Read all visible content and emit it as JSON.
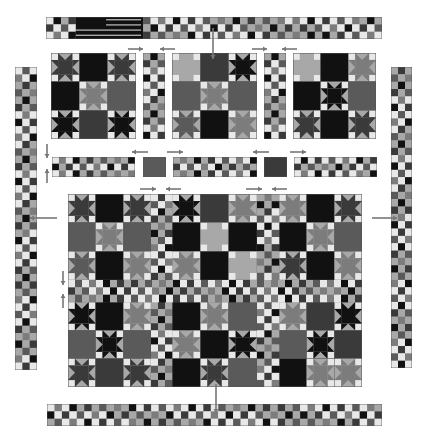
{
  "diagram": {
    "palette": {
      "K": "#111111",
      "D": "#3a3a3a",
      "M": "#5a5a5a",
      "G": "#7c7c7c",
      "L": "#a8a8a8",
      "W": "#e8e8e8",
      "outline": "#555555",
      "arrow": "#777777"
    },
    "top_border": {
      "label": "Top border strip with flag block",
      "x": 46,
      "y": 17,
      "w": 336,
      "h": 22,
      "cols": 45,
      "rows": 3,
      "flag": {
        "start_col": 4,
        "end_col": 13
      },
      "pattern": [
        "WLW",
        "LWL",
        "WLW",
        "LWL"
      ]
    },
    "left_border": {
      "x": 15,
      "y": 67,
      "w": 22,
      "h": 303,
      "cols": 3,
      "rows": 41
    },
    "right_border": {
      "x": 391,
      "y": 67,
      "w": 21,
      "h": 301,
      "cols": 3,
      "rows": 41
    },
    "bottom_border": {
      "x": 47,
      "y": 404,
      "w": 335,
      "h": 22,
      "cols": 45,
      "rows": 3
    },
    "top_row_units": [
      {
        "type": "block3x3",
        "x": 51,
        "y": 53,
        "w": 85,
        "h": 86,
        "blocks": [
          [
            "S:D",
            "P:K",
            "S:D"
          ],
          [
            "P:K",
            "S:G",
            "P:M"
          ],
          [
            "S:K",
            "P:D",
            "S:K"
          ]
        ]
      },
      {
        "type": "sash_v",
        "x": 143,
        "y": 53,
        "w": 22,
        "h": 86,
        "rows": 12
      },
      {
        "type": "block3x3",
        "x": 172,
        "y": 53,
        "w": 85,
        "h": 86,
        "blocks": [
          [
            "S:L",
            "P:D",
            "S:K"
          ],
          [
            "P:M",
            "S:G",
            "P:M"
          ],
          [
            "S:M",
            "P:K",
            "S:G"
          ]
        ]
      },
      {
        "type": "sash_v",
        "x": 264,
        "y": 53,
        "w": 22,
        "h": 86,
        "rows": 12
      },
      {
        "type": "block3x3",
        "x": 293,
        "y": 53,
        "w": 83,
        "h": 86,
        "blocks": [
          [
            "S:L",
            "P:K",
            "S:G"
          ],
          [
            "P:K",
            "S:K",
            "P:M"
          ],
          [
            "S:D",
            "P:K",
            "S:D"
          ]
        ]
      }
    ],
    "middle_sash_row": [
      {
        "type": "sash_h",
        "x": 52,
        "y": 157,
        "w": 83,
        "h": 20,
        "cols": 12
      },
      {
        "type": "square",
        "x": 143,
        "y": 157,
        "w": 23,
        "h": 20,
        "shade": "M"
      },
      {
        "type": "sash_h",
        "x": 173,
        "y": 157,
        "w": 84,
        "h": 20,
        "cols": 12
      },
      {
        "type": "square",
        "x": 264,
        "y": 157,
        "w": 23,
        "h": 20,
        "shade": "D"
      },
      {
        "type": "sash_h",
        "x": 294,
        "y": 157,
        "w": 83,
        "h": 20,
        "cols": 12
      }
    ],
    "main_quilt": {
      "label": "Assembled quilt center",
      "x": 68,
      "y": 194,
      "w": 294,
      "h": 193,
      "col_groups": [
        68,
        151,
        172,
        257,
        279,
        362
      ],
      "row_groups": [
        194,
        280,
        302,
        387
      ],
      "top_blocks": [
        [
          [
            "S:D",
            "P:K",
            "S:D"
          ],
          [
            "P:M",
            "S:G",
            "P:M"
          ],
          [
            "S:M",
            "P:K",
            "S:G"
          ]
        ],
        [
          [
            "S:K",
            "P:D",
            "S:G"
          ],
          [
            "P:K",
            "S:L",
            "P:K"
          ],
          [
            "S:G",
            "P:K",
            "S:L"
          ]
        ],
        [
          [
            "S:G",
            "P:K",
            "S:D"
          ],
          [
            "P:K",
            "S:G",
            "P:M"
          ],
          [
            "S:D",
            "P:K",
            "S:G"
          ]
        ]
      ],
      "bottom_blocks": [
        [
          [
            "S:K",
            "P:K",
            "S:G"
          ],
          [
            "P:M",
            "S:K",
            "P:M"
          ],
          [
            "S:D",
            "P:D",
            "S:D"
          ]
        ],
        [
          [
            "P:K",
            "S:G",
            "P:M"
          ],
          [
            "S:G",
            "P:K",
            "S:K"
          ],
          [
            "P:K",
            "S:D",
            "P:M"
          ]
        ],
        [
          [
            "S:G",
            "P:D",
            "S:K"
          ],
          [
            "P:M",
            "S:K",
            "P:D"
          ],
          [
            "P:K",
            "S:G",
            "S:G"
          ]
        ]
      ]
    },
    "arrows": [
      {
        "name": "top-border-arrow",
        "x1": 213,
        "y1": 28,
        "x2": 213,
        "y2": 59,
        "dir": "down"
      },
      {
        "name": "bottom-border-arrow",
        "x1": 216,
        "y1": 384,
        "x2": 216,
        "y2": 413,
        "dir": "down"
      },
      {
        "name": "left-border-arrow",
        "x1": 57,
        "y1": 218,
        "x2": 30,
        "y2": 218,
        "dir": "left"
      },
      {
        "name": "right-border-arrow",
        "x1": 372,
        "y1": 218,
        "x2": 397,
        "y2": 218,
        "dir": "right"
      },
      {
        "name": "sash-arrow-1",
        "x1": 128,
        "y1": 49,
        "x2": 143,
        "y2": 49,
        "dir": "right"
      },
      {
        "name": "sash-arrow-2",
        "x1": 175,
        "y1": 49,
        "x2": 160,
        "y2": 49,
        "dir": "left"
      },
      {
        "name": "sash-arrow-3",
        "x1": 252,
        "y1": 49,
        "x2": 267,
        "y2": 49,
        "dir": "right"
      },
      {
        "name": "sash-arrow-4",
        "x1": 297,
        "y1": 49,
        "x2": 282,
        "y2": 49,
        "dir": "left"
      },
      {
        "name": "mid-arrow-1",
        "x1": 148,
        "y1": 152,
        "x2": 132,
        "y2": 152,
        "dir": "left"
      },
      {
        "name": "mid-arrow-2",
        "x1": 167,
        "y1": 152,
        "x2": 183,
        "y2": 152,
        "dir": "right"
      },
      {
        "name": "mid-arrow-3",
        "x1": 269,
        "y1": 152,
        "x2": 253,
        "y2": 152,
        "dir": "left"
      },
      {
        "name": "mid-arrow-4",
        "x1": 290,
        "y1": 152,
        "x2": 306,
        "y2": 152,
        "dir": "right"
      },
      {
        "name": "quilt-arrow-1",
        "x1": 140,
        "y1": 189,
        "x2": 156,
        "y2": 189,
        "dir": "right"
      },
      {
        "name": "quilt-arrow-2",
        "x1": 181,
        "y1": 189,
        "x2": 166,
        "y2": 189,
        "dir": "left"
      },
      {
        "name": "quilt-arrow-3",
        "x1": 246,
        "y1": 189,
        "x2": 262,
        "y2": 189,
        "dir": "right"
      },
      {
        "name": "quilt-arrow-4",
        "x1": 287,
        "y1": 189,
        "x2": 272,
        "y2": 189,
        "dir": "left"
      },
      {
        "name": "vert-arrow-1",
        "x1": 47,
        "y1": 144,
        "x2": 47,
        "y2": 158,
        "dir": "down"
      },
      {
        "name": "vert-arrow-2",
        "x1": 47,
        "y1": 183,
        "x2": 47,
        "y2": 169,
        "dir": "up"
      },
      {
        "name": "vert-arrow-3",
        "x1": 63,
        "y1": 271,
        "x2": 63,
        "y2": 285,
        "dir": "down"
      },
      {
        "name": "vert-arrow-4",
        "x1": 63,
        "y1": 308,
        "x2": 63,
        "y2": 294,
        "dir": "up"
      }
    ]
  }
}
